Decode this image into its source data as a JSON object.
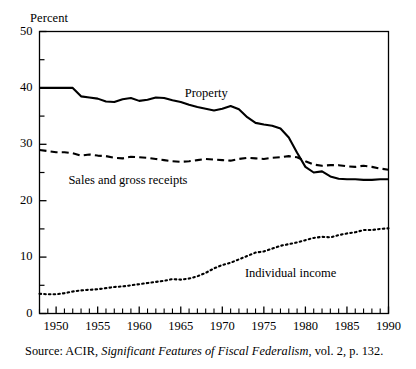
{
  "axis": {
    "y_unit_label": "Percent",
    "y_ticks": [
      "0",
      "10",
      "20",
      "30",
      "40",
      "50"
    ],
    "x_ticks": [
      "1950",
      "1955",
      "1960",
      "1965",
      "1970",
      "1975",
      "1980",
      "1985",
      "1990"
    ]
  },
  "labels": {
    "property": "Property",
    "sales": "Sales and gross receipts",
    "individual": "Individual income"
  },
  "source": {
    "prefix": "Source: ACIR, ",
    "title": "Significant Features of Fiscal Federalism",
    "suffix": ", vol. 2, p. 132."
  },
  "colors": {
    "ink": "#000000",
    "background": "#ffffff"
  },
  "chart_data": {
    "type": "line",
    "title": "",
    "xlabel": "",
    "ylabel": "Percent",
    "xlim": [
      1948,
      1990
    ],
    "ylim": [
      0,
      50
    ],
    "grid": false,
    "legend": "inline-annotations",
    "y_major_ticks": [
      0,
      10,
      20,
      30,
      40,
      50
    ],
    "y_minor_ticks": [
      5,
      15,
      25,
      35,
      45
    ],
    "x_tick_years": [
      1950,
      1955,
      1960,
      1965,
      1970,
      1975,
      1980,
      1985,
      1990
    ],
    "x_minor_tick_interval": 1,
    "x": [
      1948,
      1949,
      1950,
      1951,
      1952,
      1953,
      1954,
      1955,
      1956,
      1957,
      1958,
      1959,
      1960,
      1961,
      1962,
      1963,
      1964,
      1965,
      1966,
      1967,
      1968,
      1969,
      1970,
      1971,
      1972,
      1973,
      1974,
      1975,
      1976,
      1977,
      1978,
      1979,
      1980,
      1981,
      1982,
      1983,
      1984,
      1985,
      1986,
      1987,
      1988,
      1989,
      1990
    ],
    "series": [
      {
        "name": "Property",
        "style": "solid",
        "values": [
          40.0,
          40.0,
          40.0,
          40.0,
          40.0,
          38.5,
          38.3,
          38.1,
          37.6,
          37.5,
          38.0,
          38.2,
          37.7,
          37.9,
          38.3,
          38.2,
          37.8,
          37.5,
          37.0,
          36.6,
          36.3,
          36.0,
          36.3,
          36.8,
          36.2,
          34.8,
          33.8,
          33.5,
          33.3,
          32.8,
          31.2,
          28.5,
          26.0,
          25.0,
          25.2,
          24.3,
          23.9,
          23.8,
          23.8,
          23.7,
          23.7,
          23.8,
          23.8
        ]
      },
      {
        "name": "Sales and gross receipts",
        "style": "dashed",
        "values": [
          29.0,
          28.8,
          28.6,
          28.6,
          28.4,
          28.0,
          28.2,
          28.0,
          27.9,
          27.6,
          27.5,
          27.8,
          27.7,
          27.6,
          27.4,
          27.2,
          27.0,
          26.9,
          27.0,
          27.2,
          27.4,
          27.3,
          27.2,
          27.1,
          27.4,
          27.6,
          27.5,
          27.4,
          27.6,
          27.7,
          27.9,
          27.7,
          27.0,
          26.4,
          26.2,
          26.3,
          26.3,
          26.1,
          26.0,
          26.2,
          26.0,
          25.7,
          25.5
        ]
      },
      {
        "name": "Individual income",
        "style": "dotted",
        "values": [
          3.5,
          3.4,
          3.4,
          3.6,
          3.9,
          4.1,
          4.2,
          4.3,
          4.5,
          4.7,
          4.8,
          5.0,
          5.2,
          5.4,
          5.6,
          5.8,
          6.1,
          6.0,
          6.2,
          6.6,
          7.2,
          8.0,
          8.6,
          9.0,
          9.6,
          10.2,
          10.8,
          11.0,
          11.5,
          12.0,
          12.3,
          12.6,
          13.0,
          13.4,
          13.6,
          13.5,
          13.9,
          14.2,
          14.4,
          14.8,
          14.8,
          15.0,
          15.1
        ]
      }
    ]
  }
}
